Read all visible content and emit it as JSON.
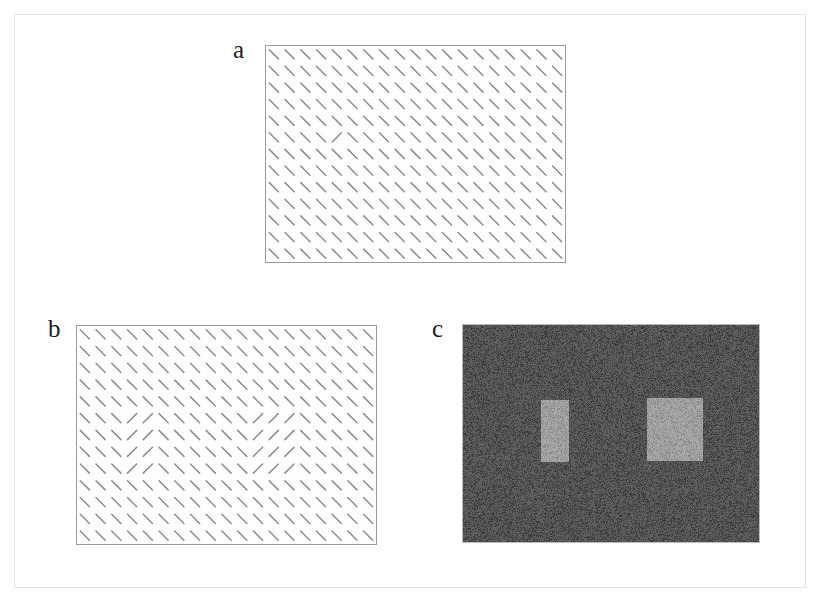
{
  "figure": {
    "background_color": "#ffffff",
    "frame_color": "#e2e2e2",
    "width": 822,
    "height": 608
  },
  "panels": [
    {
      "id": "a",
      "label": "a",
      "label_x": 233,
      "label_y": 37,
      "type": "orientation-texture",
      "box": {
        "x": 265,
        "y": 45,
        "width": 301,
        "height": 218
      },
      "border_color": "#9a9a9a",
      "background_color": "#fefefe",
      "line_color": "#8d8d8d",
      "line_width": 1.5,
      "line_length": 13,
      "grid": {
        "cols": 19,
        "rows": 13
      },
      "background_angle_deg": -45,
      "odd_angle_deg": 45,
      "odd_targets": [
        {
          "col": 4,
          "row": 5
        }
      ],
      "description": "Uniform field of oblique line elements containing a single orthogonal target line."
    },
    {
      "id": "b",
      "label": "b",
      "label_x": 48,
      "label_y": 316,
      "type": "orientation-texture",
      "box": {
        "x": 76,
        "y": 325,
        "width": 301,
        "height": 220
      },
      "border_color": "#9a9a9a",
      "background_color": "#fefefe",
      "line_color": "#8d8d8d",
      "line_width": 1.5,
      "line_length": 13,
      "grid": {
        "cols": 19,
        "rows": 13
      },
      "background_angle_deg": -45,
      "odd_angle_deg": 45,
      "odd_regions": [
        {
          "name": "small-patch",
          "col_start": 3,
          "col_end": 4,
          "row_start": 5,
          "row_end": 8
        },
        {
          "name": "large-patch",
          "col_start": 11,
          "col_end": 13,
          "row_start": 5,
          "row_end": 8
        }
      ],
      "description": "Same oblique line field containing two orthogonally oriented rectangular patches of different widths."
    },
    {
      "id": "c",
      "label": "c",
      "label_x": 432,
      "label_y": 316,
      "type": "luminance-noise",
      "box": {
        "x": 462,
        "y": 324,
        "width": 298,
        "height": 219
      },
      "border_color": "#b9b9b9",
      "background_color": "#4c4c4c",
      "noise_light": "#5e5e5e",
      "noise_dark": "#3c3c3c",
      "patch_color": "#9a9a9a",
      "patch_noise_light": "#a8a8a8",
      "patch_noise_dark": "#8c8c8c",
      "patches": [
        {
          "name": "narrow-patch",
          "x": 78,
          "y": 75,
          "width": 28,
          "height": 62
        },
        {
          "name": "wide-patch",
          "x": 184,
          "y": 73,
          "width": 56,
          "height": 63
        }
      ],
      "description": "Dark binary-noise field containing two brighter rectangular regions of different widths."
    }
  ]
}
